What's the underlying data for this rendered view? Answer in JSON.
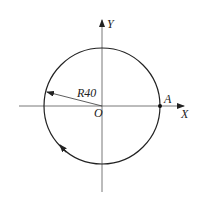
{
  "diagram": {
    "axes": {
      "x_label": "X",
      "y_label": "Y",
      "origin_label": "O"
    },
    "circle": {
      "radius_label": "R40",
      "direction": "clockwise"
    },
    "point": {
      "label": "A"
    },
    "colors": {
      "line": "#222222",
      "axis": "#555555",
      "background": "#ffffff"
    }
  }
}
